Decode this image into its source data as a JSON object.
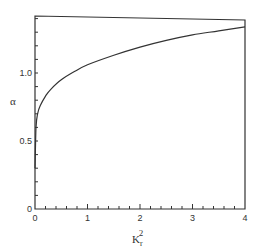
{
  "chart_data": {
    "type": "line",
    "title": "",
    "xlabel": "K_r^2",
    "ylabel": "α",
    "xlim": [
      0,
      4
    ],
    "ylim": [
      0,
      1.42
    ],
    "grid": false,
    "legend": null,
    "x_ticks": [
      0,
      1,
      2,
      3,
      4
    ],
    "x_tick_labels": [
      "0",
      "1",
      "2",
      "3",
      "4"
    ],
    "y_ticks": [
      0,
      0.5,
      1.0
    ],
    "y_tick_labels": [
      "0",
      "0.5",
      "1.0"
    ],
    "series": [
      {
        "name": "alpha",
        "x": [
          0.0,
          0.02,
          0.05,
          0.1,
          0.2,
          0.3,
          0.5,
          0.75,
          1.0,
          1.5,
          2.0,
          2.5,
          3.0,
          3.5,
          4.0
        ],
        "y": [
          0.3,
          0.6,
          0.7,
          0.76,
          0.83,
          0.88,
          0.95,
          1.01,
          1.06,
          1.13,
          1.19,
          1.24,
          1.28,
          1.31,
          1.34
        ]
      }
    ]
  },
  "labels": {
    "x_axis": "K",
    "x_sub": "r",
    "x_sup": "2",
    "y_axis": "α"
  }
}
